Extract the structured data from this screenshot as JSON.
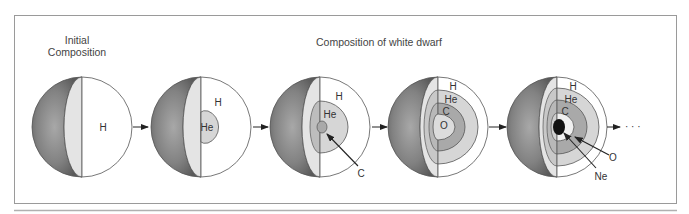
{
  "figure": {
    "initial_heading": [
      "Initial",
      "Composition"
    ],
    "white_dwarf_heading": "Composition of white dwarf",
    "continuation": "· · ·",
    "colors": {
      "frame": "#9a9a9a",
      "sphere_shell_dark": "#6e6e6e",
      "sphere_shell_light": "#b4b4b4",
      "cut_face": "#e4e4e4",
      "H": "#ffffff",
      "He": "#d6d6d6",
      "C": "#a9a9a9",
      "O": "#dcdcdc",
      "Ne": "#111111",
      "outline": "#555555"
    },
    "stages": [
      {
        "id": "stage-1",
        "layers": [
          "H"
        ],
        "labels": [
          {
            "text": "H"
          }
        ]
      },
      {
        "id": "stage-2",
        "layers": [
          "H",
          "He"
        ],
        "labels": [
          {
            "text": "H"
          },
          {
            "text": "He"
          }
        ]
      },
      {
        "id": "stage-3",
        "layers": [
          "H",
          "He",
          "C"
        ],
        "labels": [
          {
            "text": "H"
          },
          {
            "text": "He"
          },
          {
            "text": "C",
            "callout": true
          }
        ]
      },
      {
        "id": "stage-4",
        "layers": [
          "H",
          "He",
          "C",
          "O"
        ],
        "labels": [
          {
            "text": "H"
          },
          {
            "text": "He"
          },
          {
            "text": "C"
          },
          {
            "text": "O"
          }
        ]
      },
      {
        "id": "stage-5",
        "layers": [
          "H",
          "He",
          "C",
          "O",
          "Ne"
        ],
        "labels": [
          {
            "text": "H"
          },
          {
            "text": "He"
          },
          {
            "text": "C"
          },
          {
            "text": "O",
            "callout": true
          },
          {
            "text": "Ne",
            "callout": true
          }
        ]
      }
    ]
  }
}
